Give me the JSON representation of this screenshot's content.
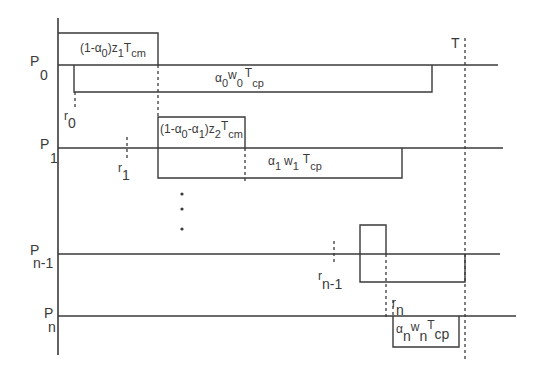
{
  "diagram": {
    "type": "timing-diagram",
    "time_axis_label": "T",
    "processors": [
      {
        "id": "P0",
        "label": "P",
        "sub": "0",
        "release": {
          "label": "r",
          "sub": "0"
        },
        "comm_label": {
          "main": "(1-",
          "alpha": "α",
          "a_sub": "0",
          "rest": ")z",
          "z_sub": "1",
          "T": "T",
          "T_sub": "cm"
        },
        "comp_label": {
          "alpha": "α",
          "a_sub": "0",
          "w": "w",
          "w_sub": "0",
          "T": "T",
          "T_sub": "cp"
        }
      },
      {
        "id": "P1",
        "label": "P",
        "sub": "1",
        "release": {
          "label": "r",
          "sub": "1"
        },
        "comm_label": {
          "main": "(1-",
          "alpha0": "α",
          "a0_sub": "0",
          "minus": "-",
          "alpha1": "α",
          "a1_sub": "1",
          "rest": ")z",
          "z_sub": "2",
          "T": "T",
          "T_sub": "cm"
        },
        "comp_label": {
          "alpha": "α",
          "a_sub": "1",
          "w": "w",
          "w_sub": "1",
          "T": "T",
          "T_sub": "cp"
        }
      },
      {
        "id": "Pn-1",
        "label": "P",
        "sub": "n-1",
        "release": {
          "label": "r",
          "sub": "n-1"
        }
      },
      {
        "id": "Pn",
        "label": "P",
        "sub": "n",
        "release": {
          "label": "r",
          "sub": "n"
        },
        "comp_label": {
          "alpha": "α",
          "a_sub": "n",
          "w": "w",
          "w_sub": "n",
          "T": "T",
          "T_sub": "cp"
        }
      }
    ],
    "ellipsis": "⋮"
  }
}
